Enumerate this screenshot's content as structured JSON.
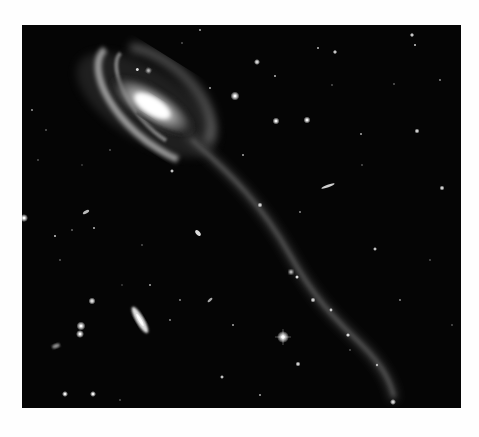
{
  "image": {
    "subject": "spiral galaxy with long tidal tail in star field",
    "background_color": "#fefefe",
    "field_color": "#050505",
    "frame": {
      "x": 22,
      "y": 25,
      "width": 439,
      "height": 383
    },
    "galaxy_core": {
      "cx": 150,
      "cy": 105
    },
    "companion_galaxies": [
      {
        "cx": 140,
        "cy": 320,
        "rx": 5,
        "ry": 16,
        "rotate": -30
      },
      {
        "cx": 328,
        "cy": 186,
        "rx": 1.5,
        "ry": 7,
        "rotate": 70
      },
      {
        "cx": 200,
        "cy": 235,
        "rx": 2,
        "ry": 3.5,
        "rotate": -40
      },
      {
        "cx": 86,
        "cy": 212,
        "rx": 2,
        "ry": 4,
        "rotate": 60
      },
      {
        "cx": 56,
        "cy": 347,
        "rx": 2,
        "ry": 4,
        "rotate": 70
      }
    ],
    "stars": [
      [
        24,
        218,
        2.2
      ],
      [
        55,
        236,
        1
      ],
      [
        72,
        230,
        0.8
      ],
      [
        94,
        228,
        1
      ],
      [
        92,
        301,
        2
      ],
      [
        81,
        326,
        2.5
      ],
      [
        80,
        334,
        2.2
      ],
      [
        257,
        62,
        1.6
      ],
      [
        235,
        96,
        1.8
      ],
      [
        275,
        76,
        1
      ],
      [
        276,
        121,
        1.7
      ],
      [
        307,
        120,
        1.7
      ],
      [
        318,
        48,
        1
      ],
      [
        335,
        52,
        1.2
      ],
      [
        412,
        35,
        1.2
      ],
      [
        415,
        45,
        1
      ],
      [
        394,
        84,
        0.8
      ],
      [
        417,
        131,
        1.4
      ],
      [
        283,
        337,
        3
      ],
      [
        233,
        325,
        1
      ],
      [
        313,
        300,
        1.4
      ],
      [
        298,
        364,
        1.4
      ],
      [
        222,
        377,
        1.2
      ],
      [
        393,
        402,
        1.6
      ],
      [
        361,
        134,
        1
      ],
      [
        442,
        188,
        1.4
      ],
      [
        375,
        249,
        1.2
      ],
      [
        65,
        394,
        1.7
      ],
      [
        93,
        394,
        1.7
      ],
      [
        32,
        110,
        0.9
      ],
      [
        46,
        130,
        0.8
      ],
      [
        150,
        285,
        1
      ],
      [
        60,
        260,
        0.8
      ],
      [
        400,
        300,
        0.9
      ],
      [
        430,
        260,
        0.8
      ],
      [
        350,
        350,
        0.8
      ],
      [
        180,
        300,
        0.8
      ],
      [
        260,
        395,
        1
      ],
      [
        120,
        400,
        0.8
      ],
      [
        200,
        30,
        1
      ],
      [
        440,
        80,
        0.9
      ],
      [
        170,
        320,
        0.9
      ],
      [
        38,
        160,
        0.8
      ],
      [
        110,
        150,
        0.8
      ],
      [
        260,
        205,
        1.6
      ],
      [
        243,
        155,
        1
      ],
      [
        300,
        212,
        0.9
      ]
    ]
  }
}
